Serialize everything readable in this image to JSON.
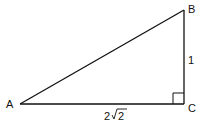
{
  "diagram": {
    "type": "right-triangle",
    "vertices": {
      "A": {
        "label": "A"
      },
      "B": {
        "label": "B"
      },
      "C": {
        "label": "C"
      }
    },
    "sides": {
      "BC": {
        "label": "1"
      },
      "AC": {
        "label_coef": "2",
        "label_radicand": "2"
      }
    },
    "right_angle_at": "C",
    "stroke_color": "#111111"
  }
}
